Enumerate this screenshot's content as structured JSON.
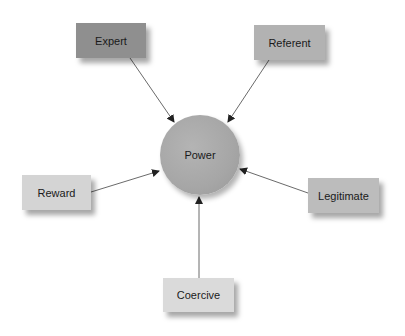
{
  "diagram": {
    "center": {
      "label": "Power",
      "color": "#a8a8a8"
    },
    "nodes": [
      {
        "id": "expert",
        "label": "Expert",
        "color": "#8f8f8f"
      },
      {
        "id": "referent",
        "label": "Referent",
        "color": "#b2b2b2"
      },
      {
        "id": "reward",
        "label": "Reward",
        "color": "#d4d4d4"
      },
      {
        "id": "legitimate",
        "label": "Legitimate",
        "color": "#bcbcbc"
      },
      {
        "id": "coercive",
        "label": "Coercive",
        "color": "#dadada"
      }
    ],
    "edges": [
      {
        "from": "Expert",
        "to": "Power"
      },
      {
        "from": "Referent",
        "to": "Power"
      },
      {
        "from": "Reward",
        "to": "Power"
      },
      {
        "from": "Legitimate",
        "to": "Power"
      },
      {
        "from": "Coercive",
        "to": "Power"
      }
    ]
  }
}
